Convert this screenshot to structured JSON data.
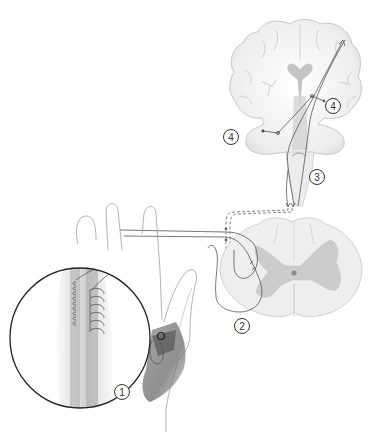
{
  "diagram": {
    "colors": {
      "background": "#ffffff",
      "tissue_light": "#f2f2f2",
      "tissue_mid": "#e0e0e0",
      "grey_matter": "#c8c8c8",
      "muscle_dark": "#6e6e6e",
      "outline": "#8a8a8a",
      "nerve_line": "#555555",
      "label_stroke": "#333333"
    },
    "labels": [
      {
        "id": "1",
        "text": "1",
        "x": 122,
        "y": 392,
        "target": "muscle in hand"
      },
      {
        "id": "2",
        "text": "2",
        "x": 242,
        "y": 326,
        "target": "spinal cord reflex loop"
      },
      {
        "id": "3",
        "text": "3",
        "x": 317,
        "y": 177,
        "target": "ascending tract in brainstem"
      },
      {
        "id": "4a",
        "text": "4",
        "x": 333,
        "y": 106,
        "target": "cerebral cortex"
      },
      {
        "id": "4b",
        "text": "4",
        "x": 231,
        "y": 137,
        "target": "cerebellum"
      }
    ],
    "structures": {
      "brain": {
        "name": "brain-coronal-section"
      },
      "spinal_cord": {
        "name": "spinal-cord-cross-section"
      },
      "hand": {
        "name": "hand-outline"
      },
      "magnified_spindle": {
        "name": "muscle-spindle-magnified-inset"
      }
    }
  }
}
